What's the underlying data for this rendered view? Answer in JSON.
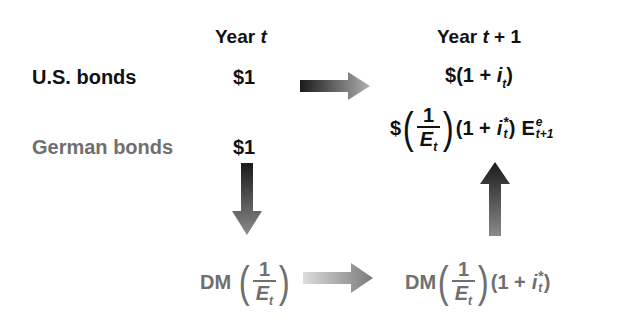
{
  "headers": {
    "col1": {
      "prefix": "Year ",
      "var": "t"
    },
    "col2": {
      "prefix": "Year ",
      "var": "t",
      "suffix": " + 1"
    }
  },
  "rows": {
    "us": {
      "label": "U.S. bonds",
      "year_t_value": "$1",
      "year_t1_value": {
        "currency": "$",
        "open": "(1 + ",
        "rate": "i",
        "rate_sub": "t",
        "close": ")"
      }
    },
    "german": {
      "label": "German bonds",
      "year_t_value": "$1"
    }
  },
  "dollar_return_german": {
    "currency": "$",
    "frac_num": "1",
    "frac_den": "E",
    "frac_den_sub": "t",
    "factor_open": "(1 + ",
    "rate": "i",
    "rate_sup": "*",
    "rate_sub": "t",
    "factor_close": ")",
    "expected_rate": "E",
    "expected_sup": "e",
    "expected_sub": "t+1"
  },
  "dm_conversion": {
    "currency": "DM",
    "frac_num": "1",
    "frac_den": "E",
    "frac_den_sub": "t"
  },
  "dm_return": {
    "currency": "DM",
    "frac_num": "1",
    "frac_den": "E",
    "frac_den_sub": "t",
    "factor_open": "(1 + ",
    "rate": "i",
    "rate_sup": "*",
    "rate_sub": "t",
    "factor_close": ")"
  },
  "arrows": [
    {
      "name": "us-invest-arrow",
      "direction": "right"
    },
    {
      "name": "convert-to-dm-arrow",
      "direction": "down"
    },
    {
      "name": "german-invest-arrow",
      "direction": "right"
    },
    {
      "name": "convert-back-arrow",
      "direction": "up"
    }
  ],
  "colors": {
    "primary_text": "#111111",
    "german_text": "#6f6f6f"
  }
}
